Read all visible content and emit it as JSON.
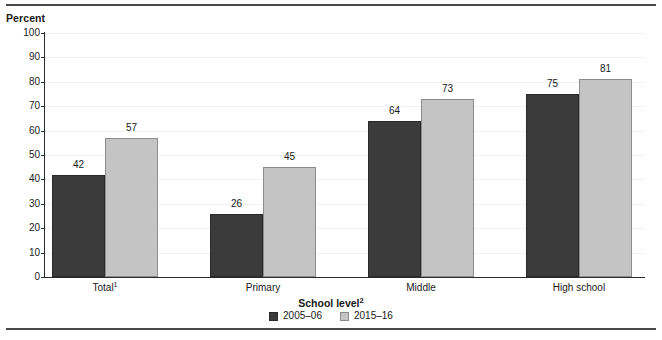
{
  "figure": {
    "y_axis_title": "Percent",
    "x_axis_title": "School level",
    "x_axis_title_footnote": "2",
    "top_rule": true,
    "bottom_rule": true
  },
  "chart_data": {
    "type": "bar",
    "title": "",
    "subtitle": "",
    "xlabel": "School level²",
    "ylabel": "Percent",
    "categories": [
      "Total¹",
      "Primary",
      "Middle",
      "High school"
    ],
    "category_footnotes": [
      "1",
      "",
      "",
      ""
    ],
    "series": [
      {
        "name": "2005–06",
        "color": "#3b3b3b",
        "values": [
          42,
          26,
          64,
          75
        ]
      },
      {
        "name": "2015–16",
        "color": "#c4c4c4",
        "values": [
          57,
          45,
          73,
          81
        ]
      }
    ],
    "ylim": [
      0,
      100
    ],
    "yticks": [
      0,
      10,
      20,
      30,
      40,
      50,
      60,
      70,
      80,
      90,
      100
    ],
    "ytick_labels": [
      "0",
      "10",
      "20",
      "30",
      "40",
      "50",
      "60",
      "70",
      "80",
      "90",
      "100"
    ],
    "grid": true,
    "grid_color": "#f2f2f2",
    "legend_position": "bottom-center",
    "data_labels_shown": true
  },
  "legend": {
    "items": [
      {
        "label": "2005–06",
        "swatch": "dark-gray-swatch"
      },
      {
        "label": "2015–16",
        "swatch": "light-gray-swatch"
      }
    ]
  },
  "colors": {
    "series_2005_06": "#3b3b3b",
    "series_2015_16": "#c4c4c4",
    "axis": "#2b2b2b",
    "grid": "#f2f2f2",
    "rule": "#4a4a4a",
    "text": "#1a1a1a"
  }
}
